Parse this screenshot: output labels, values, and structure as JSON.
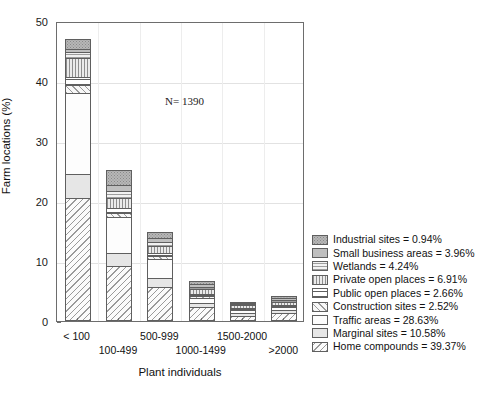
{
  "chart_data": {
    "type": "bar",
    "subtype": "stacked",
    "title": "",
    "xlabel": "Plant individuals",
    "ylabel": "Farm locations (%)",
    "ylim": [
      0,
      50
    ],
    "yticks": [
      0,
      10,
      20,
      30,
      40,
      50
    ],
    "grid": true,
    "legend_position": "right-outside",
    "annotation": "N= 1390",
    "categories": [
      "< 100",
      "100-499",
      "500-999",
      "1000-1499",
      "1500-2000",
      ">2000"
    ],
    "series": [
      {
        "name": "Home compounds",
        "pattern": "diagonal-hatch-backslash",
        "legend_value": "39.37%",
        "values": [
          20.5,
          9.2,
          5.7,
          2.3,
          0.9,
          1.3
        ]
      },
      {
        "name": "Marginal sites",
        "pattern": "solid-light-gray",
        "legend_value": "10.58%",
        "values": [
          4.0,
          2.1,
          1.4,
          0.7,
          0.4,
          0.5
        ]
      },
      {
        "name": "Traffic areas",
        "pattern": "plain-white",
        "legend_value": "28.63%",
        "values": [
          13.5,
          6.0,
          3.3,
          0.9,
          0.5,
          0.5
        ]
      },
      {
        "name": "Construction sites",
        "pattern": "diagonal-hatch-slash",
        "legend_value": "2.52%",
        "values": [
          1.4,
          0.7,
          0.5,
          0.3,
          0.2,
          0.2
        ]
      },
      {
        "name": "Public open places",
        "pattern": "horizontal-lines-bold",
        "legend_value": "2.66%",
        "values": [
          1.2,
          0.8,
          0.5,
          0.3,
          0.2,
          0.2
        ]
      },
      {
        "name": "Private open places",
        "pattern": "vertical-lines",
        "legend_value": "6.91%",
        "values": [
          3.2,
          1.7,
          1.1,
          0.8,
          0.4,
          0.5
        ]
      },
      {
        "name": "Wetlands",
        "pattern": "horizontal-lines-light",
        "legend_value": "4.24%",
        "values": [
          1.0,
          1.2,
          0.7,
          0.4,
          0.2,
          0.3
        ]
      },
      {
        "name": "Small business areas",
        "pattern": "solid-gray",
        "legend_value": "3.96%",
        "values": [
          0.6,
          1.0,
          0.6,
          0.4,
          0.2,
          0.3
        ]
      },
      {
        "name": "Industrial sites",
        "pattern": "stipple-gray",
        "legend_value": "0.94%",
        "values": [
          1.6,
          2.5,
          1.1,
          0.5,
          0.1,
          0.4
        ]
      }
    ],
    "totals": [
      47.0,
      25.2,
      14.9,
      6.6,
      3.1,
      4.2
    ]
  },
  "axes": {
    "ylabel": "Farm locations (%)",
    "xlabel": "Plant individuals",
    "yticks": [
      "0",
      "10",
      "20",
      "30",
      "40",
      "50"
    ],
    "xcats": [
      "< 100",
      "100-499",
      "500-999",
      "1000-1499",
      "1500-2000",
      ">2000"
    ]
  },
  "annotation": {
    "sample_size": "N= 1390"
  },
  "legend": {
    "items": [
      {
        "label": "Industrial sites = 0.94%"
      },
      {
        "label": "Small business areas = 3.96%"
      },
      {
        "label": "Wetlands = 4.24%"
      },
      {
        "label": "Private open places = 6.91%"
      },
      {
        "label": "Public open places = 2.66%"
      },
      {
        "label": "Construction sites = 2.52%"
      },
      {
        "label": "Traffic areas = 28.63%"
      },
      {
        "label": "Marginal sites = 10.58%"
      },
      {
        "label": "Home compounds = 39.37%"
      }
    ]
  },
  "colors": {
    "axis": "#6d6d6d",
    "grid": "#e2e2e2",
    "text": "#111111",
    "bar_outline": "#5f5f5f"
  }
}
